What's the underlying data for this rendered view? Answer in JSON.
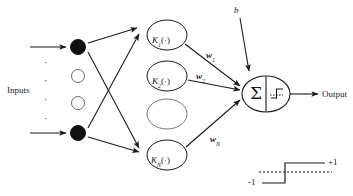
{
  "diagram": {
    "colors": {
      "stroke": "#1a1a1a",
      "node_fill_solid": "#111111",
      "node_fill_hollow": "#ffffff",
      "text": "#1a1a1a",
      "background": "#ffffff"
    },
    "labels": {
      "inputs": "Inputs",
      "output": "Output",
      "bias": "b"
    },
    "input_nodes": [
      {
        "name": "input-node-top",
        "style": "filled"
      },
      {
        "name": "input-node-mid-1",
        "style": "hollow"
      },
      {
        "name": "input-node-mid-2",
        "style": "hollow"
      },
      {
        "name": "input-node-bottom",
        "style": "filled"
      }
    ],
    "input_dots": [
      "·",
      "·",
      "·",
      "·"
    ],
    "kernel_nodes": [
      {
        "name": "kernel-node-1",
        "label": "K",
        "subscript": "1",
        "arg": "(·)",
        "empty": false
      },
      {
        "name": "kernel-node-2",
        "label": "K",
        "subscript": "2",
        "arg": "(·)",
        "empty": false
      },
      {
        "name": "kernel-node-placeholder",
        "label": "",
        "subscript": "",
        "arg": "",
        "empty": true
      },
      {
        "name": "kernel-node-N",
        "label": "K",
        "subscript": "N",
        "arg": "(·)",
        "empty": false
      }
    ],
    "weights": [
      {
        "name": "weight-label-1",
        "symbol": "w",
        "subscript": "1"
      },
      {
        "name": "weight-label-2",
        "symbol": "w",
        "subscript": "2"
      },
      {
        "name": "weight-label-N",
        "symbol": "w",
        "subscript": "N"
      }
    ],
    "neuron": {
      "sum_symbol": "Σ",
      "activation": "sign-step-function"
    },
    "legend": {
      "name": "activation-legend",
      "type": "sign-step-function",
      "high_label": "+1",
      "low_label": "-1"
    }
  }
}
